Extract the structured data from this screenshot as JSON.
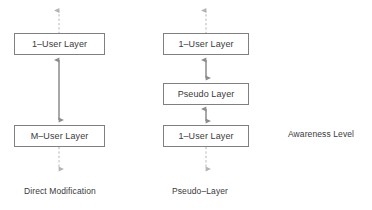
{
  "figure": {
    "background_color": "#ffffff",
    "line_color": "#808080",
    "text_color": "#3a3a3a",
    "width": 372,
    "height": 210
  },
  "columns": [
    {
      "id": "direct-modification",
      "caption": "Direct Modification",
      "boxes": [
        {
          "label": "1–User Layer"
        },
        {
          "label": "M–User Layer"
        }
      ],
      "connectors": [
        {
          "id": "top-inbound",
          "style": "dashed",
          "heads": "up"
        },
        {
          "id": "between-1-2",
          "style": "solid",
          "heads": "both"
        },
        {
          "id": "bottom-outbound",
          "style": "dashed",
          "heads": "down"
        }
      ]
    },
    {
      "id": "pseudo-layer",
      "caption": "Pseudo–Layer",
      "boxes": [
        {
          "label": "1–User Layer"
        },
        {
          "label": "Pseudo Layer"
        },
        {
          "label": "1–User Layer"
        }
      ],
      "connectors": [
        {
          "id": "top-inbound",
          "style": "dashed",
          "heads": "up"
        },
        {
          "id": "between-1-2",
          "style": "solid",
          "heads": "both"
        },
        {
          "id": "between-2-3",
          "style": "solid",
          "heads": "both"
        },
        {
          "id": "bottom-outbound",
          "style": "dashed",
          "heads": "down"
        }
      ]
    }
  ],
  "annotations": {
    "awareness_level": "Awareness Level"
  }
}
